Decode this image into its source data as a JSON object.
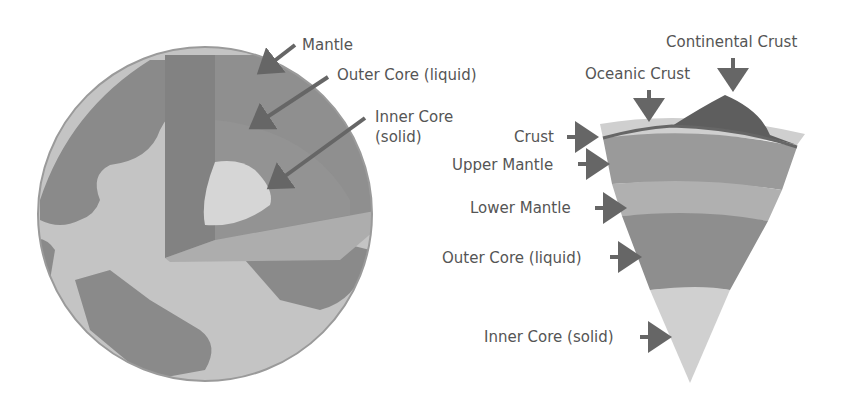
{
  "figure": {
    "left_panel": {
      "title": "Earth cutaway",
      "labels": {
        "mantle": "Mantle",
        "outer_core": "Outer Core (liquid)",
        "inner_core_line1": "Inner Core",
        "inner_core_line2": "(solid)"
      }
    },
    "right_panel": {
      "title": "Earth layer wedge",
      "labels": {
        "continental_crust": "Continental Crust",
        "oceanic_crust": "Oceanic Crust",
        "crust": "Crust",
        "upper_mantle": "Upper Mantle",
        "lower_mantle": "Lower Mantle",
        "outer_core": "Outer Core (liquid)",
        "inner_core": "Inner Core (solid)"
      }
    },
    "colors": {
      "land": "#8a8a8a",
      "ocean": "#c4c4c4",
      "mantle": "#9a9a9a",
      "outer_core": "#8c8c8c",
      "inner_core": "#d2d2d2",
      "lower_mantle": "#b0b0b0",
      "continental": "#5e5e5e",
      "arrow": "#666666",
      "text": "#555555"
    }
  }
}
